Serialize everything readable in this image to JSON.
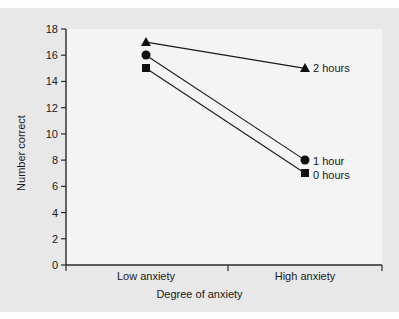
{
  "chart_data": {
    "type": "line",
    "title": "",
    "xlabel": "Degree of anxiety",
    "ylabel": "Number correct",
    "categories": [
      "Low anxiety",
      "High anxiety"
    ],
    "ylim": [
      0,
      18
    ],
    "yticks": [
      0,
      2,
      4,
      6,
      8,
      10,
      12,
      14,
      16,
      18
    ],
    "grid": false,
    "legend_position": "inline-right-of-endpoints",
    "series": [
      {
        "name": "2 hours",
        "marker": "triangle",
        "values": [
          17,
          15
        ]
      },
      {
        "name": "1 hour",
        "marker": "circle",
        "values": [
          16,
          8
        ]
      },
      {
        "name": "0 hours",
        "marker": "square",
        "values": [
          15,
          7
        ]
      }
    ]
  },
  "axis": {
    "y_tick_labels": [
      "0",
      "2",
      "4",
      "6",
      "8",
      "10",
      "12",
      "14",
      "16",
      "18"
    ],
    "x_tick_labels": [
      "Low anxiety",
      "High anxiety"
    ],
    "y_title": "Number correct",
    "x_title": "Degree of anxiety"
  },
  "series_labels": {
    "two_hours": "2 hours",
    "one_hour": "1 hour",
    "zero_hours": "0 hours"
  },
  "colors": {
    "ink": "#101010",
    "page_background": "#e8e8e8",
    "panel_background": "#f4f4f4",
    "axis_line": "#2b2b2b"
  }
}
